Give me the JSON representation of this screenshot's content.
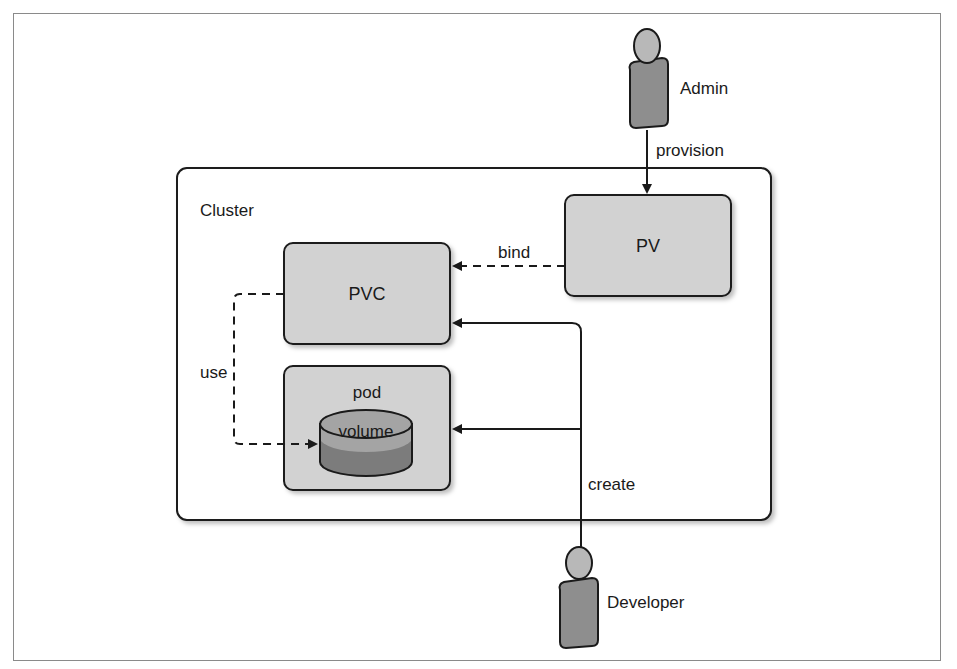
{
  "diagram": {
    "type": "kubernetes-persistent-volume-flow",
    "actors": {
      "admin": {
        "label": "Admin"
      },
      "developer": {
        "label": "Developer"
      }
    },
    "cluster": {
      "label": "Cluster"
    },
    "nodes": {
      "pv": {
        "label": "PV"
      },
      "pvc": {
        "label": "PVC"
      },
      "pod": {
        "label": "pod"
      },
      "volume": {
        "label": "volume"
      }
    },
    "edges": [
      {
        "from": "Admin",
        "to": "PV",
        "label": "provision",
        "style": "solid"
      },
      {
        "from": "PV",
        "to": "PVC",
        "label": "bind",
        "style": "dashed"
      },
      {
        "from": "PVC",
        "to": "volume",
        "label": "use",
        "style": "dashed"
      },
      {
        "from": "Developer",
        "to": "PVC",
        "label": "create",
        "style": "solid"
      },
      {
        "from": "Developer",
        "to": "pod",
        "label": "create",
        "style": "solid"
      }
    ],
    "edge_labels": {
      "provision": "provision",
      "bind": "bind",
      "use": "use",
      "create": "create"
    },
    "colors": {
      "box_fill": "#d2d2d2",
      "box_stroke": "#2a2a2a",
      "person_head": "#b8b8b8",
      "person_body": "#8e8e8e",
      "volume_top": "#a4a4a4",
      "volume_body": "#7c7c7c",
      "frame": "#8a8a8a",
      "line": "#1a1a1a"
    }
  }
}
